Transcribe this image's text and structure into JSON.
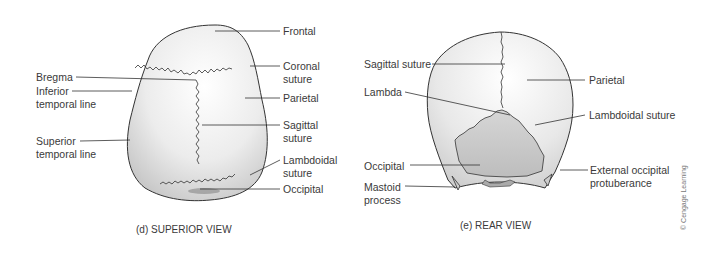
{
  "figure_d": {
    "caption": "(d) SUPERIOR VIEW",
    "labels": {
      "frontal": "Frontal",
      "coronal_suture_1": "Coronal",
      "coronal_suture_2": "suture",
      "parietal": "Parietal",
      "sagittal_suture_1": "Sagittal",
      "sagittal_suture_2": "suture",
      "lambdoidal_suture_1": "Lambdoidal",
      "lambdoidal_suture_2": "suture",
      "occipital": "Occipital",
      "bregma": "Bregma",
      "inferior_temporal_1": "Inferior",
      "inferior_temporal_2": "temporal line",
      "superior_temporal_1": "Superior",
      "superior_temporal_2": "temporal line"
    }
  },
  "figure_e": {
    "caption": "(e) REAR VIEW",
    "labels": {
      "sagittal_suture": "Sagittal suture",
      "lambda": "Lambda",
      "parietal": "Parietal",
      "lambdoidal_suture": "Lambdoidal suture",
      "occipital": "Occipital",
      "mastoid_1": "Mastoid",
      "mastoid_2": "process",
      "ext_occ_1": "External occipital",
      "ext_occ_2": "protuberance"
    }
  },
  "credit": "© Cengage Learning"
}
